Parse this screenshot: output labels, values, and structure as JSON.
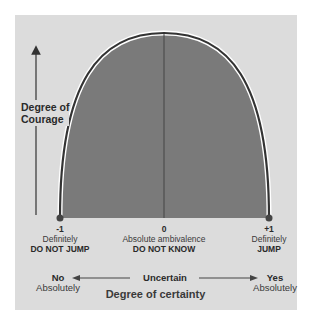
{
  "diagram": {
    "y_axis_label_line1": "Degree of",
    "y_axis_label_line2": "Courage",
    "x_axis_title": "Degree of certainty",
    "points": [
      {
        "value": "-1",
        "line1": "Definitely",
        "line2": "DO NOT JUMP"
      },
      {
        "value": "0",
        "line1": "Absolute ambivalence",
        "line2": "DO NOT KNOW"
      },
      {
        "value": "+1",
        "line1": "Definitely",
        "line2": "JUMP"
      }
    ],
    "scale": {
      "left_label": "No",
      "left_sub": "Absolutely",
      "center_label": "Uncertain",
      "right_label": "Yes",
      "right_sub": "Absolutely"
    },
    "colors": {
      "background": "#dcdcdc",
      "fill": "#7a7a7a",
      "curve": "#333333"
    }
  }
}
